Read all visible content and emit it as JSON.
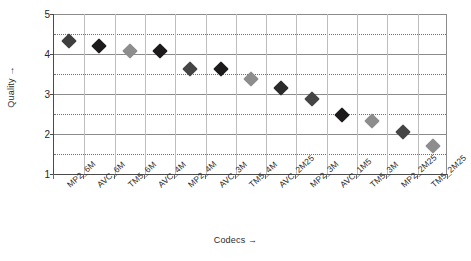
{
  "chart_data": {
    "type": "scatter",
    "title": "",
    "xlabel": "Codecs →",
    "ylabel": "Quality →",
    "ylim": [
      1,
      5
    ],
    "y_ticks": [
      1,
      2,
      3,
      4,
      5
    ],
    "y_minor_ticks": [
      1.5,
      2.5,
      3.5,
      4.5
    ],
    "grid": {
      "major_horizontal": "solid",
      "minor_horizontal": "dotted",
      "vertical": "solid-light",
      "legend": "none"
    },
    "categories": [
      "MP2_6M",
      "AVC_6M",
      "TM5_6M",
      "AVC_4M",
      "MP2_4M",
      "AVC_3M",
      "TM5_4M",
      "AVC_2M25",
      "MP2_3M",
      "AVC_1M5",
      "TM5_3M",
      "MP2_2M25",
      "TM5_2M25"
    ],
    "values": [
      4.33,
      4.19,
      4.08,
      4.07,
      3.62,
      3.62,
      3.37,
      3.16,
      2.87,
      2.47,
      2.33,
      2.05,
      1.7
    ],
    "point_colors": [
      "#3f3f3f",
      "#1c1a1a",
      "#8d8d8d",
      "#1c1a1a",
      "#454545",
      "#1c1a1a",
      "#8d8d8d",
      "#2b2b2b",
      "#454545",
      "#1c1a1a",
      "#8d8d8d",
      "#454545",
      "#8d8d8d"
    ],
    "marker": "diamond"
  },
  "colors": {
    "axis": "#4a4a4a",
    "grid_major": "#8a8a8a",
    "grid_minor": "#6f6f6f",
    "grid_vertical": "#bdbdbd",
    "text": "#2b2b2b",
    "background": "#ffffff"
  }
}
